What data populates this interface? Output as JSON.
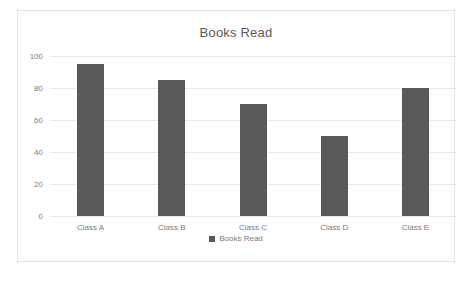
{
  "chart_data": {
    "type": "bar",
    "title": "Books Read",
    "categories": [
      "Class A",
      "Class B",
      "Class C",
      "Class D",
      "Class E"
    ],
    "values": [
      95,
      85,
      70,
      50,
      80
    ],
    "series": [
      {
        "name": "Books Read",
        "values": [
          95,
          85,
          70,
          50,
          80
        ]
      }
    ],
    "xlabel": "",
    "ylabel": "",
    "ylim": [
      0,
      100
    ],
    "yticks": [
      0,
      20,
      40,
      60,
      80,
      100
    ],
    "ytick_labels": [
      "0",
      "20",
      "40",
      "60",
      "80",
      "100"
    ],
    "grid": true,
    "legend": {
      "position": "bottom",
      "entries": [
        {
          "label": "Books Read",
          "marker": "square-marker",
          "color": "#595959"
        }
      ]
    },
    "colors": {
      "bar": "#595959",
      "gridline": "#e8e8e8",
      "text": "#7b7b7b",
      "title_text": "#595959",
      "background": "#ffffff",
      "frame_border": "#e3e3e3"
    }
  }
}
